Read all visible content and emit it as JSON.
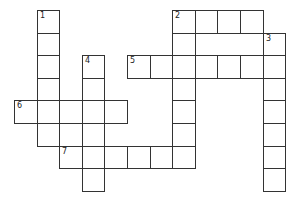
{
  "puzzle": {
    "type": "crossword",
    "cell_size": 22.6,
    "origin": {
      "x": 14,
      "y": 10
    },
    "grid_cols": 13,
    "grid_rows": 8,
    "colors": {
      "border": "#333333",
      "cell_fill": "#ffffff",
      "number": "#222222"
    },
    "cells": [
      {
        "r": 0,
        "c": 1,
        "n": "1"
      },
      {
        "r": 1,
        "c": 1
      },
      {
        "r": 2,
        "c": 1
      },
      {
        "r": 3,
        "c": 1
      },
      {
        "r": 4,
        "c": 1
      },
      {
        "r": 5,
        "c": 1
      },
      {
        "r": 0,
        "c": 7,
        "n": "2"
      },
      {
        "r": 0,
        "c": 8
      },
      {
        "r": 0,
        "c": 9
      },
      {
        "r": 0,
        "c": 10
      },
      {
        "r": 1,
        "c": 7
      },
      {
        "r": 2,
        "c": 7
      },
      {
        "r": 3,
        "c": 7
      },
      {
        "r": 4,
        "c": 7
      },
      {
        "r": 5,
        "c": 7
      },
      {
        "r": 6,
        "c": 7
      },
      {
        "r": 1,
        "c": 11,
        "n": "3"
      },
      {
        "r": 2,
        "c": 11
      },
      {
        "r": 3,
        "c": 11
      },
      {
        "r": 4,
        "c": 11
      },
      {
        "r": 5,
        "c": 11
      },
      {
        "r": 6,
        "c": 11
      },
      {
        "r": 7,
        "c": 11
      },
      {
        "r": 2,
        "c": 3,
        "n": "4"
      },
      {
        "r": 3,
        "c": 3
      },
      {
        "r": 4,
        "c": 3
      },
      {
        "r": 5,
        "c": 3
      },
      {
        "r": 6,
        "c": 3
      },
      {
        "r": 7,
        "c": 3
      },
      {
        "r": 2,
        "c": 5,
        "n": "5"
      },
      {
        "r": 2,
        "c": 6
      },
      {
        "r": 2,
        "c": 8
      },
      {
        "r": 2,
        "c": 9
      },
      {
        "r": 2,
        "c": 10
      },
      {
        "r": 4,
        "c": 0,
        "n": "6"
      },
      {
        "r": 4,
        "c": 2
      },
      {
        "r": 4,
        "c": 4
      },
      {
        "r": 5,
        "c": 2
      },
      {
        "r": 6,
        "c": 2,
        "n": "7"
      },
      {
        "r": 6,
        "c": 4
      },
      {
        "r": 6,
        "c": 5
      },
      {
        "r": 6,
        "c": 6
      }
    ],
    "words": [
      {
        "number": "1",
        "direction": "down",
        "row": 0,
        "col": 1,
        "length": 6
      },
      {
        "number": "2",
        "direction": "across",
        "row": 0,
        "col": 7,
        "length": 4
      },
      {
        "number": "2",
        "direction": "down",
        "row": 0,
        "col": 7,
        "length": 7
      },
      {
        "number": "3",
        "direction": "down",
        "row": 1,
        "col": 11,
        "length": 7
      },
      {
        "number": "4",
        "direction": "down",
        "row": 2,
        "col": 3,
        "length": 6
      },
      {
        "number": "5",
        "direction": "across",
        "row": 2,
        "col": 5,
        "length": 7
      },
      {
        "number": "6",
        "direction": "across",
        "row": 4,
        "col": 0,
        "length": 5
      },
      {
        "number": "7",
        "direction": "across",
        "row": 6,
        "col": 2,
        "length": 6
      }
    ]
  }
}
